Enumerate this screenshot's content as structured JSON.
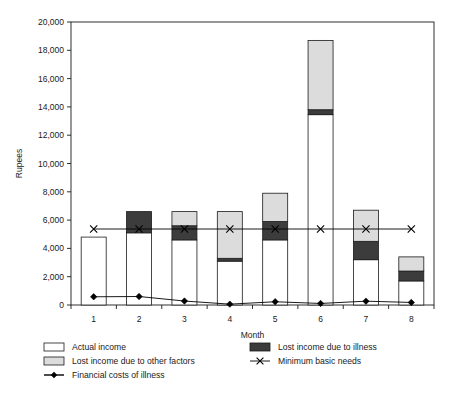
{
  "chart_data": {
    "type": "bar",
    "title": "",
    "subtitle": "",
    "xlabel": "Month",
    "ylabel": "Rupees",
    "categories": [
      "1",
      "2",
      "3",
      "4",
      "5",
      "6",
      "7",
      "8"
    ],
    "xtick_labels": [
      "1",
      "2",
      "3",
      "4",
      "5",
      "6",
      "7",
      "8"
    ],
    "ytick_labels": [
      "0",
      "2,000",
      "4,000",
      "6,000",
      "8,000",
      "10,000",
      "12,000",
      "14,000",
      "16,000",
      "18,000",
      "20,000"
    ],
    "ytick_values": [
      0,
      2000,
      4000,
      6000,
      8000,
      10000,
      12000,
      14000,
      16000,
      18000,
      20000
    ],
    "ylim": [
      0,
      20000
    ],
    "grid": false,
    "stacked": true,
    "legend_position": "below",
    "series": [
      {
        "name": "Actual income",
        "kind": "bar-segment",
        "color": "#ffffff",
        "values": [
          4800,
          5100,
          4600,
          3100,
          4600,
          13450,
          3200,
          1700
        ]
      },
      {
        "name": "Lost income due to illness",
        "kind": "bar-segment",
        "color": "#3c3c3c",
        "values": [
          0,
          1500,
          1000,
          200,
          1300,
          350,
          1300,
          700
        ]
      },
      {
        "name": "Lost income due to other factors",
        "kind": "bar-segment",
        "color": "#dcdcdc",
        "values": [
          0,
          0,
          1000,
          3300,
          2000,
          4900,
          2200,
          1000
        ]
      },
      {
        "name": "Minimum basic needs",
        "kind": "line",
        "marker": "x",
        "color": "#000000",
        "values": [
          5370,
          5370,
          5370,
          5370,
          5370,
          5370,
          5370,
          5370
        ]
      },
      {
        "name": "Financial costs of illness",
        "kind": "line",
        "marker": "diamond",
        "color": "#000000",
        "values": [
          580,
          600,
          280,
          60,
          230,
          110,
          270,
          180
        ]
      }
    ],
    "bar_totals": [
      4800,
      6600,
      6600,
      6600,
      7900,
      18700,
      6700,
      3400
    ]
  },
  "legend": {
    "entries": [
      {
        "label": "Actual income",
        "swatch": "white-box",
        "column": 1
      },
      {
        "label": "Lost income due to other factors",
        "swatch": "lightgray-box",
        "column": 1
      },
      {
        "label": "Financial costs of illness",
        "swatch": "diamond-line",
        "column": 1
      },
      {
        "label": "Lost income due to illness",
        "swatch": "darkgray-box",
        "column": 2
      },
      {
        "label": "Minimum basic needs",
        "swatch": "x-line",
        "column": 2
      }
    ]
  },
  "colors": {
    "actual_income": "#ffffff",
    "lost_income_illness": "#3c3c3c",
    "lost_income_other": "#dcdcdc",
    "axis": "#1a1a1a",
    "background": "#ffffff"
  }
}
